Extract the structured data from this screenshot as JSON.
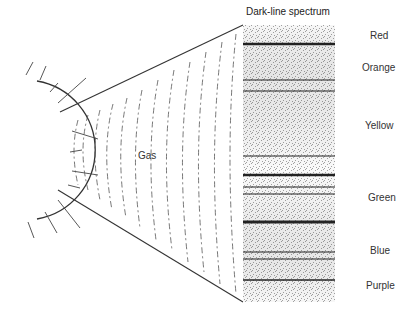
{
  "diagram": {
    "title": "Dark-line spectrum",
    "source_label": "Gas",
    "colors": {
      "ink": "#222222",
      "background": "#ffffff"
    },
    "spectrum": {
      "x": 243,
      "y": 25,
      "width": 92,
      "height": 277,
      "bands": [
        {
          "label": "Red",
          "label_y": 38
        },
        {
          "label": "Orange",
          "label_y": 70
        },
        {
          "label": "Yellow",
          "label_y": 128
        },
        {
          "label": "Green",
          "label_y": 200
        },
        {
          "label": "Blue",
          "label_y": 253
        },
        {
          "label": "Purple",
          "label_y": 288
        }
      ],
      "absorption_lines": [
        {
          "y": 44,
          "w": 2.5
        },
        {
          "y": 80,
          "w": 1
        },
        {
          "y": 91,
          "w": 1
        },
        {
          "y": 156,
          "w": 1
        },
        {
          "y": 175,
          "w": 2.5
        },
        {
          "y": 187,
          "w": 1
        },
        {
          "y": 194,
          "w": 1
        },
        {
          "y": 222,
          "w": 3
        },
        {
          "y": 252,
          "w": 1
        },
        {
          "y": 259,
          "w": 1
        },
        {
          "y": 280,
          "w": 1.5
        }
      ]
    }
  }
}
